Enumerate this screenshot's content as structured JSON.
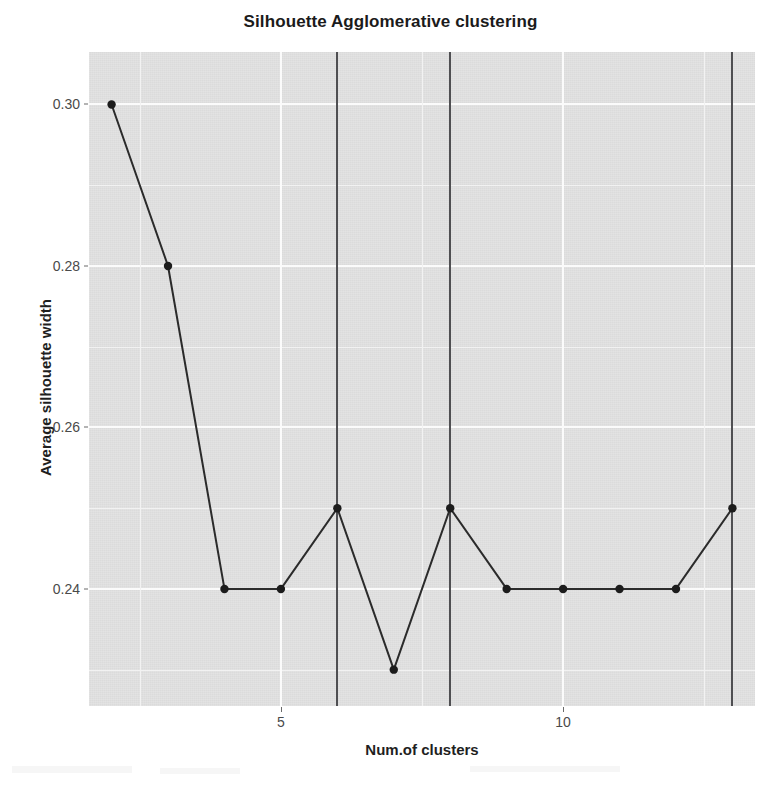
{
  "chart_data": {
    "type": "line",
    "title": "Silhouette Agglomerative clustering",
    "xlabel": "Num.of clusters",
    "ylabel": "Average silhouette width",
    "x": [
      2,
      3,
      4,
      5,
      6,
      7,
      8,
      9,
      10,
      11,
      12,
      13
    ],
    "values": [
      0.3,
      0.28,
      0.24,
      0.24,
      0.25,
      0.23,
      0.25,
      0.24,
      0.24,
      0.24,
      0.24,
      0.25
    ],
    "series": [
      {
        "name": "Average silhouette width",
        "values": [
          0.3,
          0.28,
          0.24,
          0.24,
          0.25,
          0.23,
          0.25,
          0.24,
          0.24,
          0.24,
          0.24,
          0.25
        ]
      }
    ],
    "xlim": [
      1.6,
      13.4
    ],
    "ylim": [
      0.2255,
      0.3065
    ],
    "xticks": [
      5,
      10
    ],
    "xtick_labels": [
      "5",
      "10"
    ],
    "yticks": [
      0.24,
      0.26,
      0.28,
      0.3
    ],
    "ytick_labels": [
      "0.24",
      "0.26",
      "0.28",
      "0.30"
    ],
    "x_minor_ticks": [
      2.5,
      7.5,
      12.5
    ],
    "y_minor_ticks": [
      0.23,
      0.25,
      0.27,
      0.29
    ],
    "vertical_reference_lines": [
      6,
      8,
      13
    ],
    "grid": true,
    "legend": false,
    "legend_position": "none",
    "marker": "filled-circle",
    "line_color": "#2b2b2b",
    "marker_color": "#1c1c1c",
    "vline_color": "#4f4f52",
    "panel_background": "#e2e2e2",
    "grid_color": "#fbfbfb"
  },
  "figure": {
    "width": 781,
    "height": 788,
    "background": "#ffffff"
  }
}
